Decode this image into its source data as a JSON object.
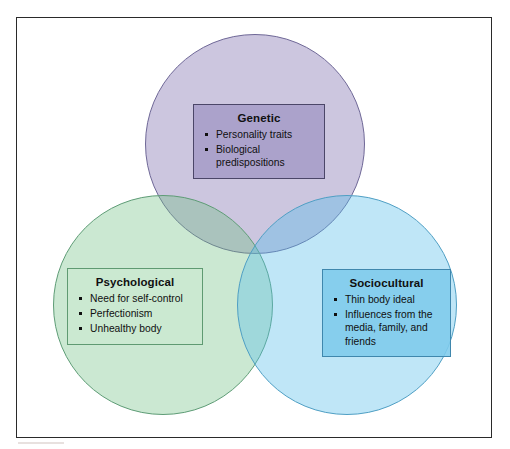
{
  "figure": {
    "type": "venn-diagram-3-circle",
    "background_color": "#ffffff",
    "frame_border_color": "#2a2a2a"
  },
  "chart_data": {
    "type": "venn",
    "title": "",
    "sets": [
      {
        "id": "genetic",
        "label": "Genetic",
        "position": "top",
        "circle_fill": "#8676b3",
        "circle_stroke": "#6f6897",
        "box_fill": "#9e94c4",
        "box_stroke": "#4b4668",
        "items": [
          "Personality traits",
          "Biological predispositions"
        ]
      },
      {
        "id": "psychological",
        "label": "Psychological",
        "position": "bottom-left",
        "circle_fill": "#6ebe82",
        "circle_stroke": "#5e9c76",
        "box_fill": "#cbe8d1",
        "box_stroke": "#5f9a72",
        "items": [
          "Need for self-control",
          "Perfectionism",
          "Unhealthy body"
        ]
      },
      {
        "id": "sociocultural",
        "label": "Sociocultural",
        "position": "bottom-right",
        "circle_fill": "#56beeb",
        "circle_stroke": "#4f9fc4",
        "box_fill": "#7ecbec",
        "box_stroke": "#3f87ad",
        "items": [
          "Thin body ideal",
          "Influences from the media, family, and friends"
        ]
      }
    ],
    "overlaps": [
      {
        "sets": [
          "genetic",
          "psychological"
        ],
        "label": ""
      },
      {
        "sets": [
          "genetic",
          "sociocultural"
        ],
        "label": ""
      },
      {
        "sets": [
          "psychological",
          "sociocultural"
        ],
        "label": ""
      },
      {
        "sets": [
          "genetic",
          "psychological",
          "sociocultural"
        ],
        "label": ""
      }
    ]
  }
}
